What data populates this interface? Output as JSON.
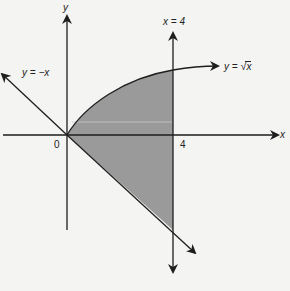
{
  "diagram": {
    "axes": {
      "x_label": "x",
      "y_label": "y"
    },
    "ticks": {
      "origin": "0",
      "x_four": "4"
    },
    "curves": {
      "sqrt_label_prefix": "y = ",
      "sqrt_label_radicand": "x",
      "neg_line_label": "y = −x",
      "vertical_line_label": "x = 4"
    },
    "shading": {
      "description": "Region bounded by y = √x above, y = −x below, and x = 4 on the right",
      "color": "#9a9a9a"
    },
    "colors": {
      "ink": "#1e1e1e",
      "background": "#f4f4f2",
      "fill": "#9a9a9a"
    }
  }
}
